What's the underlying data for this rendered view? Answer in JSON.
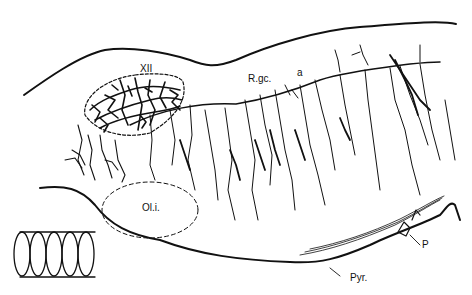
{
  "figure": {
    "type": "anatomical line drawing",
    "labels": {
      "hypoglossal_nucleus": "XII",
      "raphe": "R.gc.",
      "axon_a": "a",
      "inferior_olive": "Ol.i.",
      "pyramid": "Pyr.",
      "p": "P"
    },
    "inset": "stacked-slices-icon",
    "caption_partial": "(caption text cut off at bottom edge)"
  }
}
